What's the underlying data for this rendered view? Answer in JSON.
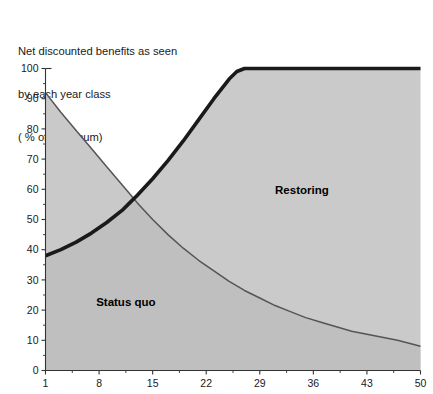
{
  "title": {
    "line1": "Net discounted benefits as seen",
    "line2": "by each year class",
    "line3": "( % of maximum)"
  },
  "colors": {
    "fill_light": "#c9c9c9",
    "fill_dark": "#bdbdbd",
    "curve_thin": "#555555",
    "curve_thick": "#1a1a1a",
    "axis": "#333333",
    "background": "#ffffff",
    "text": "#000000"
  },
  "chart_data": {
    "type": "area",
    "title": "Net discounted benefits as seen by each year class ( % of maximum)",
    "xlabel": "",
    "ylabel": "",
    "xlim": [
      1,
      50
    ],
    "ylim": [
      0,
      100
    ],
    "xticks": [
      1,
      8,
      15,
      22,
      29,
      36,
      43,
      50
    ],
    "xtick_labels": [
      "1",
      "8",
      "15",
      "22",
      "29",
      "36",
      "43",
      "50"
    ],
    "yticks": [
      0,
      10,
      20,
      30,
      40,
      50,
      60,
      70,
      80,
      90,
      100
    ],
    "ytick_labels": [
      "0",
      "10",
      "20",
      "30",
      "40",
      "50",
      "60",
      "70",
      "80",
      "90",
      "100"
    ],
    "grid": false,
    "minor_ticks": true,
    "legend": "none",
    "annotations": [
      {
        "text": "Restoring",
        "x": 34.5,
        "y": 58.5
      },
      {
        "text": "Status quo",
        "x": 11.5,
        "y": 21.5
      }
    ],
    "series": [
      {
        "name": "Status quo",
        "style": "thin-line-filled-area",
        "x": [
          1,
          3,
          5,
          7,
          9,
          11,
          12,
          13,
          15,
          17,
          19,
          21,
          23,
          25,
          27,
          29,
          31,
          33,
          35,
          37,
          39,
          41,
          43,
          45,
          47,
          50
        ],
        "values": [
          92,
          85.5,
          79.5,
          73.5,
          67.5,
          61.5,
          58.5,
          55.5,
          50,
          45,
          40.5,
          36.5,
          33,
          29.5,
          26.5,
          24,
          21.5,
          19.5,
          17.5,
          16,
          14.5,
          13,
          12,
          11,
          10,
          8
        ]
      },
      {
        "name": "Restoring",
        "style": "thick-line-filled-area",
        "x": [
          1,
          3,
          5,
          7,
          9,
          11,
          12,
          13,
          15,
          17,
          19,
          21,
          23,
          25,
          26,
          27,
          29,
          33,
          37,
          41,
          45,
          50
        ],
        "values": [
          38,
          40,
          42.5,
          45.5,
          49,
          53,
          55.5,
          58,
          63.5,
          69.5,
          76,
          83,
          90,
          96.5,
          99,
          100,
          100,
          100,
          100,
          100,
          100,
          100
        ]
      }
    ]
  }
}
